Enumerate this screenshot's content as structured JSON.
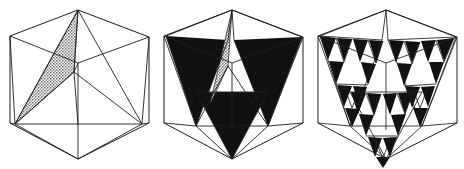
{
  "plate": {
    "name": "icosahedral-sierpinski-progression",
    "background_color": "#ffffff",
    "ink_color": "#1a1a1a",
    "fill_color": "#111111",
    "hatch_color": "#8c8c8c",
    "width": 464,
    "height": 169,
    "panel_count": 3,
    "caption": ""
  },
  "panels": [
    {
      "id": "stage-0",
      "label": "",
      "x": 2,
      "width": 152,
      "description": "icosahedron wireframe with one stippled triangular face",
      "filled_faces": 0,
      "hatched_faces": 1,
      "subdivision_level": 0
    },
    {
      "id": "stage-1",
      "label": "",
      "x": 156,
      "width": 152,
      "description": "icosahedron wireframe with three solid black inverted triangles",
      "filled_faces": 3,
      "hatched_faces": 1,
      "subdivision_level": 1
    },
    {
      "id": "stage-2",
      "label": "",
      "x": 310,
      "width": 152,
      "description": "icosahedron wireframe with triangles recursively subdivided into smaller black triangles",
      "filled_faces": 27,
      "hatched_faces": 0,
      "subdivision_level": 2
    }
  ],
  "geometry": {
    "hull_type": "hexagon",
    "hull_vertices": [
      [
        76,
        10
      ],
      [
        148,
        37
      ],
      [
        148,
        124
      ],
      [
        76,
        159
      ],
      [
        8,
        124
      ],
      [
        8,
        37
      ]
    ],
    "center": [
      76,
      72
    ],
    "inner_vertices": [
      [
        40,
        126
      ],
      [
        112,
        126
      ],
      [
        76,
        72
      ]
    ],
    "stroke_width": 0.9
  }
}
